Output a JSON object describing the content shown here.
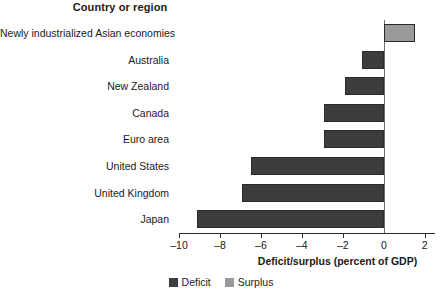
{
  "chart_data": {
    "type": "bar",
    "orientation": "horizontal",
    "title": "",
    "ylabel": "Country or region",
    "xlabel": "Deficit/surplus (percent of GDP)",
    "categories": [
      "Newly industrialized Asian economies",
      "Australia",
      "New Zealand",
      "Canada",
      "Euro area",
      "United States",
      "United Kingdom",
      "Japan"
    ],
    "values": [
      1.5,
      -1.05,
      -1.9,
      -2.9,
      -2.9,
      -6.5,
      -6.9,
      -9.1
    ],
    "xlim": [
      -10,
      2.5
    ],
    "xticks": [
      -10,
      -8,
      -6,
      -4,
      -2,
      0,
      2
    ],
    "xticklabels": [
      "–10",
      "–8",
      "–6",
      "–4",
      "–2",
      "0",
      "2"
    ],
    "grid": false,
    "legend": {
      "position": "bottom-center",
      "entries": [
        {
          "label": "Deficit",
          "color": "#3d3d3d"
        },
        {
          "label": "Surplus",
          "color": "#9a9a9a"
        }
      ]
    },
    "colors": {
      "deficit": "#3d3d3d",
      "surplus": "#9a9a9a",
      "bar_edge": "#2a2a2a",
      "axis": "#2a2a2a"
    }
  }
}
